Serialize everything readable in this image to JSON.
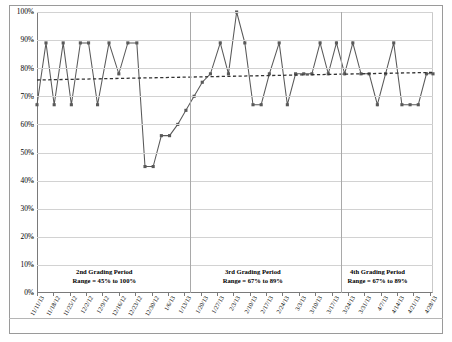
{
  "chart_data": {
    "type": "line",
    "title": "",
    "xlabel": "",
    "ylabel": "",
    "ylim": [
      0,
      100
    ],
    "ytick_labels": [
      "100%",
      "90%",
      "80%",
      "70%",
      "60%",
      "50%",
      "40%",
      "30%",
      "20%",
      "10%",
      "0%"
    ],
    "ytick_values": [
      100,
      90,
      80,
      70,
      60,
      50,
      40,
      30,
      20,
      10,
      0
    ],
    "grid": true,
    "legend": "none",
    "categories": [
      "11/11/13",
      "11/18/12",
      "11/25/12",
      "12/2/12",
      "12/9/12",
      "12/16/12",
      "12/23/12",
      "12/30/12",
      "1/6/13",
      "1/13/13",
      "1/20/13",
      "1/27/13",
      "2/3/13",
      "2/10/13",
      "2/17/13",
      "2/24/13",
      "3/3/13",
      "3/10/13",
      "3/17/13",
      "3/24/13",
      "3/31/13",
      "4/7/13",
      "4/14/13",
      "4/21/13",
      "4/28/13"
    ],
    "series": [
      {
        "name": "Grade Percent",
        "type": "line-marker",
        "color": "#595959",
        "x": [
          0.0,
          0.55,
          1.05,
          1.6,
          2.1,
          2.65,
          3.15,
          3.7,
          4.4,
          5.0,
          5.55,
          6.1,
          6.6,
          7.1,
          7.6,
          8.1,
          8.6,
          9.1,
          9.6,
          10.1,
          10.6,
          11.2,
          11.7,
          12.2,
          12.7,
          13.2,
          13.7,
          14.2,
          14.8,
          15.3,
          15.8,
          16.3,
          16.8,
          17.3,
          17.8,
          18.3,
          18.8,
          19.3,
          19.8,
          20.3,
          20.8,
          21.3,
          21.8,
          22.3,
          22.8,
          23.3,
          23.8,
          24.2
        ],
        "values": [
          67,
          89,
          67,
          89,
          67,
          89,
          89,
          67,
          89,
          78,
          89,
          89,
          45,
          45,
          56,
          56,
          60,
          65,
          70,
          75,
          78,
          89,
          78,
          100,
          89,
          67,
          67,
          78,
          89,
          67,
          78,
          78,
          78,
          89,
          78,
          89,
          78,
          89,
          78,
          78,
          67,
          78,
          89,
          67,
          67,
          67,
          78,
          78
        ]
      },
      {
        "name": "Trendline",
        "type": "dashed-line",
        "color": "#333333",
        "x": [
          0,
          24.2
        ],
        "values": [
          75.8,
          78.5
        ]
      }
    ],
    "dividers": [
      {
        "after_category": "1/13/13",
        "x": 9.35
      },
      {
        "after_category": "3/17/13",
        "x": 18.55
      }
    ],
    "annotations": [
      {
        "name": "2nd Grading Period",
        "title": "2nd Grading Period",
        "range": "Range = 45% to 100%",
        "x_center": 0.17
      },
      {
        "name": "3rd Grading Period",
        "title": "3rd Grading Period",
        "range": "Range = 67% to 89%",
        "x_center": 0.545
      },
      {
        "name": "4th Grading Period",
        "title": "4th Grading Period",
        "range": "Range = 67% to 89%",
        "x_center": 0.86
      }
    ]
  }
}
